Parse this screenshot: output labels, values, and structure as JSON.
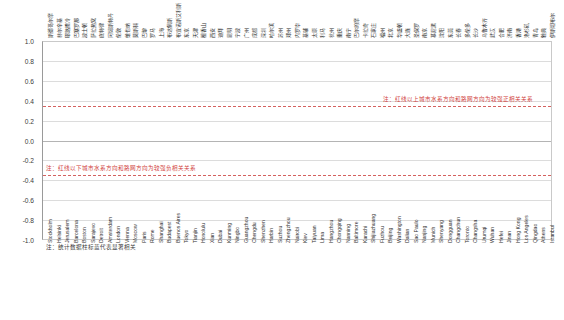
{
  "chart_data": {
    "type": "bar",
    "title": "",
    "subtitle": "",
    "xlabel": "",
    "ylabel": "",
    "ylim": [
      -1.0,
      1.0
    ],
    "yticks": [
      "1.0",
      "0.8",
      "0.6",
      "0.4",
      "0.2",
      "0.0",
      "-0.2",
      "-0.4",
      "-0.6",
      "-0.8",
      "-1.0"
    ],
    "ytick_values": [
      1.0,
      0.8,
      0.6,
      0.4,
      0.2,
      0.0,
      -0.2,
      -0.4,
      -0.6,
      -0.8,
      -1.0
    ],
    "grid": true,
    "legend": "none",
    "positive_threshold": 0.35,
    "negative_threshold": -0.35,
    "categories": [
      "Stockholm",
      "Helsinki",
      "Jerusalem",
      "Barcelona",
      "Boston",
      "Sarajevo",
      "Detroit",
      "Amsterdam",
      "London",
      "Vienna",
      "Moscow",
      "Paris",
      "Rome",
      "Shanghai",
      "Budapest",
      "Buenos Aires",
      "Tokyo",
      "Tianjin",
      "Honolulu",
      "Xian",
      "Dubai",
      "Kunming",
      "Ningbo",
      "Guangzhou",
      "Chengdu",
      "Shenzhen",
      "Harbin",
      "Suzhou",
      "Zhengzhou",
      "Nairobi",
      "Kiev",
      "Taiyuan",
      "Lima",
      "Hangzhou",
      "Chongqing",
      "Nanning",
      "Baltimore",
      "Karachi",
      "Shijiazhuang",
      "Fuzhou",
      "Beijing",
      "Washington",
      "Dalian",
      "Sao Paulo",
      "Nanjing",
      "Munich",
      "Shenyang",
      "Dongguan",
      "Changchun",
      "Toronto",
      "Changsha",
      "Urumqi",
      "Wuhan",
      "Hefei",
      "Jinan",
      "Hong Kong",
      "Los Angeles",
      "Qingdao",
      "Athens",
      "Istanbul"
    ],
    "categories_cn": [
      "斯德哥尔摩",
      "赫尔辛基",
      "耶路撒冷",
      "巴塞罗那",
      "波士顿",
      "萨拉热窝",
      "底特律",
      "阿姆斯特丹",
      "伦敦",
      "维也纳",
      "莫斯科",
      "巴黎",
      "罗马",
      "上海",
      "布达佩斯",
      "布宜诺斯艾利斯",
      "东京",
      "天津",
      "檀香山",
      "西安",
      "迪拜",
      "昆明",
      "宁波",
      "广州",
      "成都",
      "深圳",
      "哈尔滨",
      "苏州",
      "郑州",
      "内罗毕",
      "基辅",
      "太原",
      "利马",
      "杭州",
      "重庆",
      "南宁",
      "巴尔的摩",
      "卡拉奇",
      "石家庄",
      "福州",
      "北京",
      "华盛顿",
      "大连",
      "圣保罗",
      "南京",
      "慕尼黑",
      "沈阳",
      "东莞",
      "长春",
      "多伦多",
      "长沙",
      "乌鲁木齐",
      "武汉",
      "合肥",
      "济南",
      "香港",
      "洛杉矶",
      "青岛",
      "雅典",
      "伊斯坦布尔"
    ],
    "values": [
      0.99,
      0.98,
      0.96,
      0.92,
      0.91,
      0.91,
      0.91,
      0.89,
      0.88,
      0.86,
      0.85,
      0.84,
      0.82,
      0.81,
      0.81,
      0.8,
      0.8,
      0.71,
      0.65,
      0.62,
      0.58,
      0.56,
      0.54,
      0.51,
      0.5,
      0.49,
      0.47,
      0.45,
      0.43,
      0.42,
      0.38,
      0.34,
      0.3,
      0.27,
      0.22,
      0.18,
      0.14,
      0.14,
      0.13,
      0.13,
      0.13,
      0.13,
      0.12,
      0.12,
      0.12,
      0.11,
      0.1,
      0.08,
      0.06,
      0.04,
      -0.01,
      -0.03,
      -0.05,
      -0.12,
      -0.13,
      -0.14,
      -0.3,
      -0.41,
      -0.45,
      -0.44
    ],
    "significant": [
      true,
      true,
      true,
      true,
      true,
      true,
      true,
      true,
      true,
      true,
      true,
      true,
      true,
      true,
      true,
      true,
      true,
      true,
      true,
      true,
      true,
      true,
      true,
      true,
      true,
      true,
      true,
      true,
      true,
      true,
      true,
      true,
      false,
      false,
      false,
      false,
      false,
      false,
      false,
      false,
      false,
      false,
      false,
      false,
      false,
      false,
      false,
      false,
      false,
      false,
      false,
      false,
      false,
      false,
      false,
      false,
      true,
      true,
      true,
      true
    ],
    "annotations": {
      "positive": "注：红线以上城市水系方向和路网方向为较强正相关关系",
      "negative": "注：红线以下城市水系方向和路网方向为较强负相关关系",
      "footnote": "注：统计数据柱标蓝代表显著相关"
    },
    "colors": {
      "bar": "#808080",
      "bar_significant": "#4f6d8c",
      "threshold_line": "#d0403c",
      "grid": "#dcdcdc",
      "axis": "#9a9a9a"
    }
  }
}
